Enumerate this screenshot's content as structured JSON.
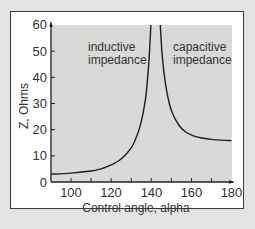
{
  "chart_data": {
    "type": "line",
    "title": "",
    "xlabel": "Control angle, alpha",
    "ylabel": "Z, Ohms",
    "xlim": [
      90,
      182
    ],
    "ylim": [
      0,
      60
    ],
    "x_ticks": [
      100,
      120,
      140,
      160,
      180
    ],
    "x_minor_ticks": [
      110,
      130,
      150,
      170
    ],
    "y_ticks": [
      0,
      10,
      20,
      30,
      40,
      50,
      60
    ],
    "grid": false,
    "legend": null,
    "annotations": [
      {
        "text": [
          "inductive",
          "impedance"
        ],
        "x": 113,
        "y": 52
      },
      {
        "text": [
          "capacitive",
          "impedance"
        ],
        "x": 160,
        "y": 52
      }
    ],
    "series": [
      {
        "name": "inductive branch",
        "x": [
          90,
          100,
          110,
          115,
          120,
          125,
          130,
          133,
          135,
          137,
          138,
          139,
          139.8
        ],
        "values": [
          3,
          3.4,
          4.2,
          5.0,
          6.5,
          8.8,
          13,
          18,
          23,
          31,
          38,
          48,
          60
        ]
      },
      {
        "name": "capacitive branch",
        "x": [
          144.5,
          145.5,
          147,
          149,
          151,
          154,
          157,
          161,
          165,
          170,
          175,
          180
        ],
        "values": [
          60,
          48,
          38,
          30,
          25.5,
          21.5,
          19.2,
          17.6,
          16.8,
          16.3,
          16.0,
          15.8
        ]
      }
    ]
  },
  "labels": {
    "x_axis_title": "Control angle, alpha",
    "y_axis_title": "Z, Ohms",
    "inductive_line1": "inductive",
    "inductive_line2": "impedance",
    "capacitive_line1": "capacitive",
    "capacitive_line2": "impedance",
    "y_tick_0": "0",
    "y_tick_10": "10",
    "y_tick_20": "20",
    "y_tick_30": "30",
    "y_tick_40": "40",
    "y_tick_50": "50",
    "y_tick_60": "60",
    "x_tick_100": "100",
    "x_tick_120": "120",
    "x_tick_140": "140",
    "x_tick_160": "160",
    "x_tick_180": "180"
  },
  "colors": {
    "page_bg": "#e3e3e1",
    "panel_bg": "#ffffff",
    "plot_bg": "#d9d9d7",
    "line": "#1e1e1e",
    "text": "#333333"
  }
}
